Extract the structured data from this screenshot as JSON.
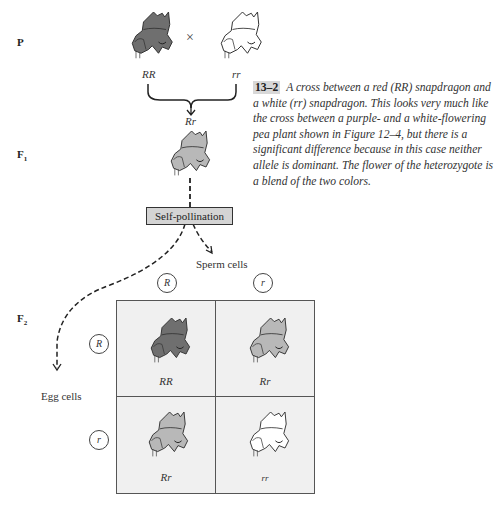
{
  "generations": {
    "p": "P",
    "f1": "F",
    "f1_sub": "1",
    "f2": "F",
    "f2_sub": "2"
  },
  "parents": {
    "left_genotype": "RR",
    "right_genotype": "rr",
    "cross_symbol": "×",
    "offspring_genotype": "Rr"
  },
  "caption": {
    "figure_number": "13–2",
    "text": "A cross between a red (RR) snapdragon and a white (rr) snapdragon. This looks very much like the cross between a purple- and a white-flowering pea plant shown in Figure 12–4, but there is a significant difference because in this case neither allele is dominant. The flower of the heterozygote is a blend of the two colors."
  },
  "process": {
    "self_pollination": "Self-pollination",
    "sperm_cells": "Sperm cells",
    "egg_cells": "Egg cells"
  },
  "punnett": {
    "sperm_alleles": [
      "R",
      "r"
    ],
    "egg_alleles": [
      "R",
      "r"
    ],
    "cells": [
      {
        "genotype": "RR",
        "flower": "red"
      },
      {
        "genotype": "Rr",
        "flower": "pink"
      },
      {
        "genotype": "Rr",
        "flower": "pink"
      },
      {
        "genotype": "rr",
        "flower": "white"
      }
    ]
  },
  "colors": {
    "red_flower": "#6f6f6f",
    "pink_flower": "#b8b8b8",
    "white_flower": "#ffffff",
    "grid_bg": "#f0f0f0",
    "box_bg": "#d4d4d4"
  }
}
